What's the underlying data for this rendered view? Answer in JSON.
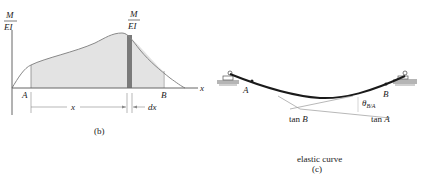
{
  "panel_b": {
    "y_axis_label_num": "M",
    "y_axis_label_den": "EI",
    "strip_label_num": "M",
    "strip_label_den": "EI",
    "x_axis_label": "x",
    "point_a": "A",
    "point_b": "B",
    "dim_x": "x",
    "dim_dx": "dx",
    "caption": "(b)",
    "colors": {
      "fill": "#e3e3e3",
      "strip": "#7a7a7a",
      "curve": "#888888",
      "axis": "#555555"
    }
  },
  "panel_c": {
    "point_a": "A",
    "point_b": "B",
    "tan_a": "tan A",
    "tan_b": "tan B",
    "theta": "θ",
    "theta_sub": "B/A",
    "caption_line1": "elastic curve",
    "caption_line2": "(c)",
    "colors": {
      "beam": "#1a1a1a",
      "tangent": "#999999",
      "ground": "#b5b5b5"
    }
  }
}
